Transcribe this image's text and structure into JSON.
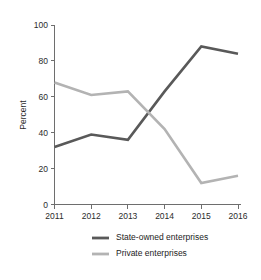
{
  "chart_data": {
    "type": "line",
    "title": "",
    "xlabel": "",
    "ylabel": "Percent",
    "x": [
      "2011",
      "2012",
      "2013",
      "2014",
      "2015",
      "2016"
    ],
    "categories": [
      "2011",
      "2012",
      "2013",
      "2014",
      "2015",
      "2016"
    ],
    "xlim": [
      2011,
      2016
    ],
    "ylim": [
      0,
      100
    ],
    "yticks": [
      "0",
      "20",
      "40",
      "60",
      "80",
      "100"
    ],
    "ytick_values": [
      0,
      20,
      40,
      60,
      80,
      100
    ],
    "grid": false,
    "legend_position": "bottom-center",
    "series": [
      {
        "name": "State-owned enterprises",
        "color": "#595959",
        "values": [
          32,
          39,
          36,
          63,
          88,
          84
        ]
      },
      {
        "name": "Private enterprises",
        "color": "#b3b3b3",
        "values": [
          68,
          61,
          63,
          42,
          12,
          16
        ]
      }
    ]
  },
  "legend": {
    "items": [
      {
        "label": "State-owned enterprises",
        "color": "#595959"
      },
      {
        "label": "Private enterprises",
        "color": "#b3b3b3"
      }
    ]
  },
  "axes": {
    "y_title": "Percent"
  },
  "colors": {
    "axis": "#6e6e6e",
    "text": "#2b2b2b",
    "background": "#ffffff",
    "series_dark": "#595959",
    "series_light": "#b3b3b3"
  }
}
